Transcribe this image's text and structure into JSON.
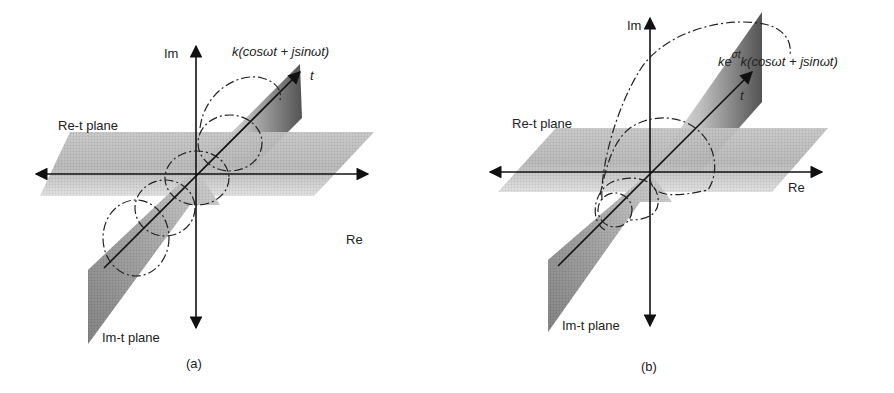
{
  "figure": {
    "panels": [
      {
        "id": "a",
        "caption": "(a)",
        "axis_im": "Im",
        "axis_re": "Re",
        "axis_t": "t",
        "plane_re_t": "Re-t plane",
        "plane_im_t": "Im-t plane",
        "formula_prefix": "",
        "formula_sup": "",
        "formula_main": "k(cosωt + jsinωt)",
        "curve": "constant-amplitude helix (rotating phasor)"
      },
      {
        "id": "b",
        "caption": "(b)",
        "axis_im": "Im",
        "axis_re": "Re",
        "axis_t": "t",
        "plane_re_t": "Re-t plane",
        "plane_im_t": "Im-t plane",
        "formula_prefix": "ke",
        "formula_sup": "σt",
        "formula_main": "k(cosωt + jsinωt)",
        "curve": "exponentially growing helix (spiral)"
      }
    ],
    "colors": {
      "ink": "#111111",
      "plane_dark": "#6a6a6a",
      "plane_light": "#f2f2f2"
    }
  }
}
